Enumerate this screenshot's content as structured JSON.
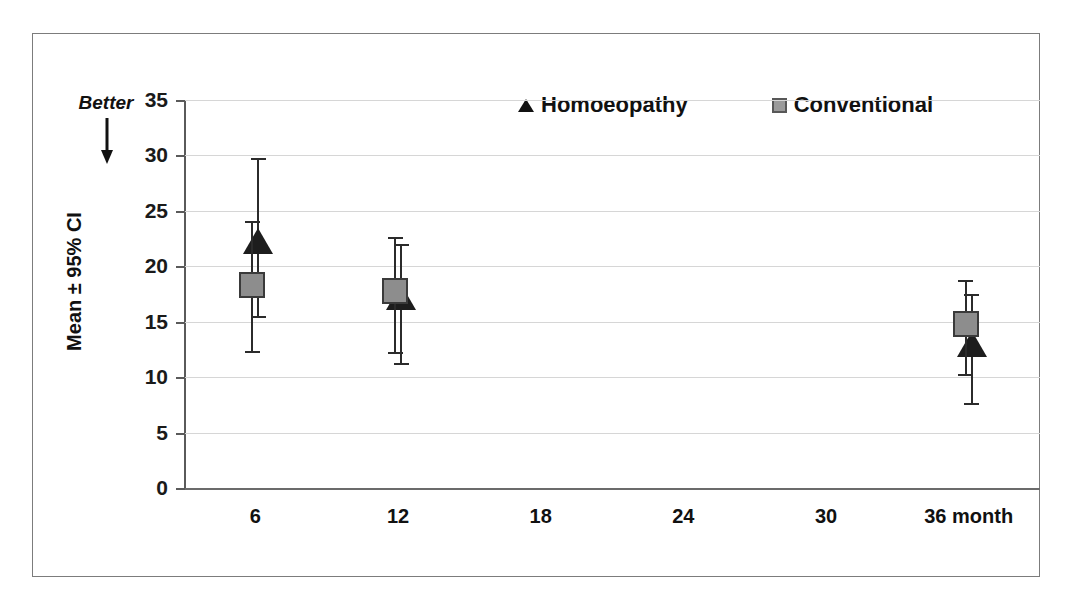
{
  "figure": {
    "better_label": "Better",
    "y_axis_title": "Mean ± 95% CI",
    "x_axis_last_label_suffix": "month"
  },
  "legend": {
    "position": "top-right-inside",
    "items": [
      {
        "label": "Homoeopathy",
        "marker": "triangle-up",
        "color": "#1d1d1d"
      },
      {
        "label": "Conventional",
        "marker": "square",
        "color": "#8d8d8d"
      }
    ]
  },
  "axes": {
    "y_ticks": [
      "0",
      "5",
      "10",
      "15",
      "20",
      "25",
      "30",
      "35"
    ],
    "x_ticks": [
      "6",
      "12",
      "18",
      "24",
      "30",
      "36 month"
    ]
  },
  "chart_data": {
    "type": "scatter",
    "title": "",
    "subtitle": "",
    "xlabel": "",
    "ylabel": "Mean ± 95% CI",
    "xlim": [
      0,
      6
    ],
    "ylim": [
      0,
      35
    ],
    "grid": true,
    "legend_position": "top-right",
    "annotations": [
      "Better"
    ],
    "categories": [
      "6",
      "12",
      "18",
      "24",
      "30",
      "36 month"
    ],
    "x": [
      6,
      12,
      18,
      24,
      30,
      36
    ],
    "series": [
      {
        "name": "Homoeopathy",
        "marker": "triangle",
        "color": "#1d1d1d",
        "points": [
          {
            "x": 6,
            "mean": 22.3,
            "ci_low": 15.5,
            "ci_high": 29.8
          },
          {
            "x": 12,
            "mean": 17.2,
            "ci_low": 11.3,
            "ci_high": 22.0
          },
          {
            "x": 36,
            "mean": 13.0,
            "ci_low": 7.7,
            "ci_high": 17.5
          }
        ]
      },
      {
        "name": "Conventional",
        "marker": "square",
        "color": "#8d8d8d",
        "points": [
          {
            "x": 6,
            "mean": 18.3,
            "ci_low": 12.4,
            "ci_high": 24.1
          },
          {
            "x": 12,
            "mean": 17.8,
            "ci_low": 12.3,
            "ci_high": 22.6
          },
          {
            "x": 36,
            "mean": 14.8,
            "ci_low": 10.3,
            "ci_high": 18.8
          }
        ]
      }
    ]
  }
}
